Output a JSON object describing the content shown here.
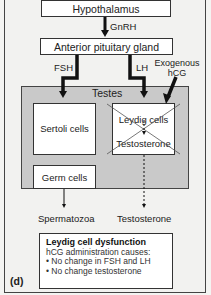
{
  "panel_label": "(d)",
  "nodes": {
    "hypothalamus": "Hypothalamus",
    "pituitary": "Anterior pituitary gland",
    "testes": "Testes",
    "sertoli": "Sertoli cells",
    "leydig": "Leydig cells",
    "testosterone_inner": "Testosterone",
    "germ": "Germ cells"
  },
  "arrows": {
    "gnrh": "GnRH",
    "fsh": "FSH",
    "lh": "LH",
    "exogenous": "Exogenous hCG"
  },
  "outputs": {
    "spermatozoa": "Spermatozoa",
    "testosterone": "Testosterone"
  },
  "info_box": {
    "title": "Leydig cell dysfunction",
    "subtitle": "hCG administration causes:",
    "bullets": [
      "No change in FSH and LH",
      "No change testosterone"
    ]
  },
  "colors": {
    "testes_fill": "#c9c9c9",
    "box_fill": "#ffffff",
    "line": "#111111"
  }
}
